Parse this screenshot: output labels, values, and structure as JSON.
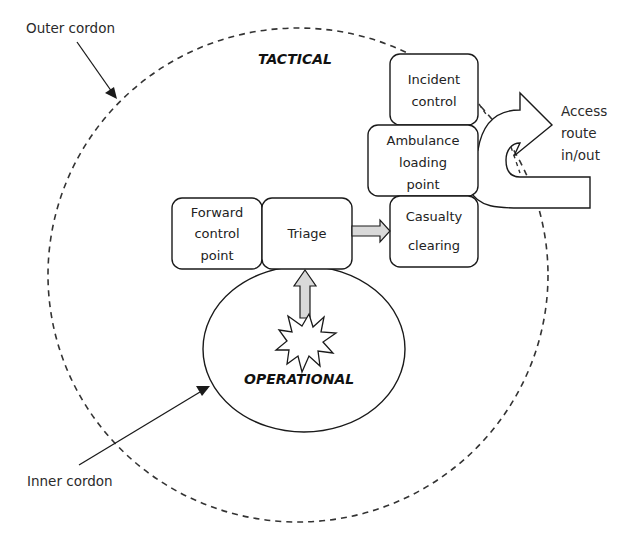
{
  "diagram": {
    "type": "incident-scene-layout",
    "zones": {
      "tactical": "TACTICAL",
      "operational": "OPERATIONAL"
    },
    "annotations": {
      "outer_cordon": "Outer cordon",
      "inner_cordon": "Inner cordon",
      "access_route": [
        "Access",
        "route",
        "in/out"
      ]
    },
    "boxes": [
      {
        "id": "incident-control",
        "lines": [
          "Incident",
          "control"
        ]
      },
      {
        "id": "ambulance-loading-point",
        "lines": [
          "Ambulance",
          "loading",
          "point"
        ]
      },
      {
        "id": "casualty-clearing",
        "lines": [
          "Casualty",
          "clearing"
        ]
      },
      {
        "id": "forward-control-point",
        "lines": [
          "Forward",
          "control",
          "point"
        ]
      },
      {
        "id": "triage",
        "lines": [
          "Triage"
        ]
      }
    ],
    "connections": [
      {
        "from": "incident-site",
        "to": "triage",
        "style": "block-arrow"
      },
      {
        "from": "triage",
        "to": "casualty-clearing",
        "style": "block-arrow"
      },
      {
        "from": "ambulance-loading-point",
        "to": "access-route",
        "style": "u-turn-arrow"
      }
    ],
    "colors": {
      "stroke": "#1a1a1a",
      "dashed": "#333333",
      "arrow_fill": "#d9d9d9",
      "background": "#ffffff"
    }
  }
}
